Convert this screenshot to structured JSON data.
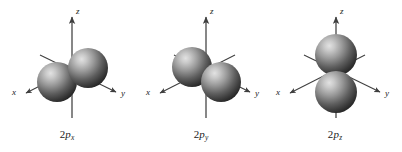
{
  "figure": {
    "background_color": "#ffffff",
    "panel_count": 3
  },
  "style": {
    "axis_color": "#3f3f3f",
    "lobe_highlight_color": "#d2d2d2",
    "lobe_mid_color": "#8a8a8a",
    "lobe_dark_color": "#2e2e2e",
    "label_color": "#1a1a1a"
  },
  "panels": [
    {
      "name": "2px-orbital",
      "label_prefix": "2",
      "label_orbital": "p",
      "label_subscript": "x",
      "label_full": "2px",
      "axes": [
        {
          "name": "x",
          "label": "x",
          "direction": "lower-left",
          "arrow": true
        },
        {
          "name": "y",
          "label": "y",
          "direction": "lower-right",
          "arrow": true
        },
        {
          "name": "z",
          "label": "z",
          "direction": "up",
          "arrow": true
        }
      ],
      "lobe_orientation": "along-x-axis",
      "lobe_description": "two spheres aligned lower-left to upper-right along the x axis"
    },
    {
      "name": "2py-orbital",
      "label_prefix": "2",
      "label_orbital": "p",
      "label_subscript": "y",
      "label_full": "2py",
      "axes": [
        {
          "name": "x",
          "label": "x",
          "direction": "lower-left",
          "arrow": true
        },
        {
          "name": "y",
          "label": "y",
          "direction": "lower-right",
          "arrow": true
        },
        {
          "name": "z",
          "label": "z",
          "direction": "up",
          "arrow": true
        }
      ],
      "lobe_orientation": "along-y-axis",
      "lobe_description": "two spheres aligned upper-left to lower-right along the y axis"
    },
    {
      "name": "2pz-orbital",
      "label_prefix": "2",
      "label_orbital": "p",
      "label_subscript": "z",
      "label_full": "2pz",
      "axes": [
        {
          "name": "x",
          "label": "x",
          "direction": "lower-left",
          "arrow": true
        },
        {
          "name": "y",
          "label": "y",
          "direction": "lower-right",
          "arrow": true
        },
        {
          "name": "z",
          "label": "z",
          "direction": "up",
          "arrow": true
        }
      ],
      "lobe_orientation": "along-z-axis",
      "lobe_description": "two spheres stacked vertically above and below the origin along the z axis"
    }
  ]
}
